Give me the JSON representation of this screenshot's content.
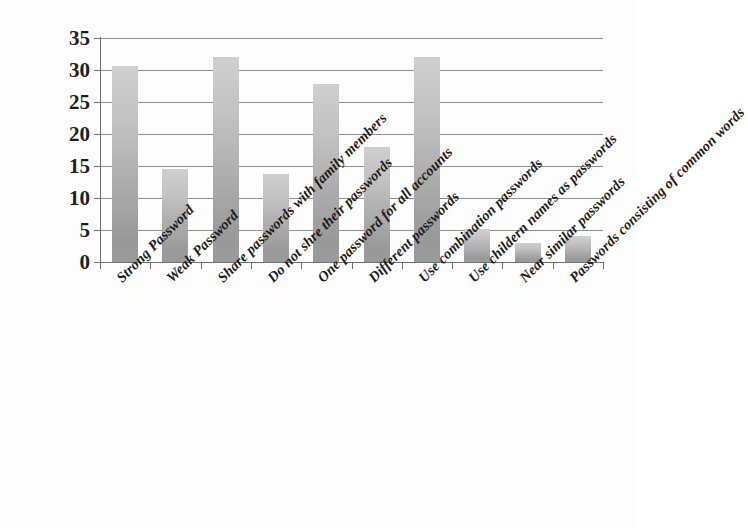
{
  "chart_data": {
    "type": "bar",
    "title": "",
    "subtitle": "",
    "xlabel": "",
    "ylabel": "",
    "ylim": [
      0,
      35
    ],
    "yticks": [
      0,
      5,
      10,
      15,
      20,
      25,
      30,
      35
    ],
    "ytick_labels": [
      "0",
      "5",
      "10",
      "15",
      "20",
      "25",
      "30",
      "35"
    ],
    "grid": true,
    "legend": false,
    "orientation": "vertical",
    "categories": [
      "Strong Password",
      "Weak Password",
      "Share passwords with family members",
      "Do not shre their passwords",
      "One password for all accounts",
      "Different passwords",
      "Use combination passwords",
      "Use childern names as passwords",
      "Near similar passwords",
      "Passwords consisting of common words"
    ],
    "values": [
      30.7,
      14.6,
      32,
      13.7,
      27.8,
      18,
      32,
      5.1,
      3,
      4
    ],
    "series": [
      {
        "name": "",
        "values": [
          30.7,
          14.6,
          32,
          13.7,
          27.8,
          18,
          32,
          5.1,
          3,
          4
        ]
      }
    ],
    "bar_color_top": "#cfcfcf",
    "bar_color_bottom": "#9a9a9a",
    "gridline_color": "#8e8e8e",
    "axis_color": "#6f6f6f",
    "text_color": "#1d1d1d",
    "background_color": "#fdfdfd"
  }
}
